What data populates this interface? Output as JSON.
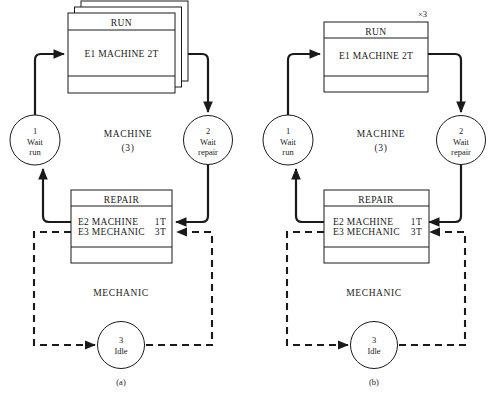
{
  "figure": {
    "background_color": "#ffffff",
    "line_color": "#1a1a1a"
  },
  "panels": [
    {
      "id": "a",
      "caption": "(a)",
      "multiplicity_label": "",
      "run_box": {
        "header": "RUN",
        "body": "E1 MACHINE 2T",
        "stacked": true,
        "stack_count": 3
      },
      "repair_box": {
        "header": "REPAIR",
        "body_line1_left": "E2 MACHINE",
        "body_line1_right": "1T",
        "body_line2_left": "E3 MECHANIC",
        "body_line2_right": "3T"
      },
      "places": [
        {
          "number": "1",
          "label_line1": "Wait",
          "label_line2": "run"
        },
        {
          "number": "2",
          "label_line1": "Wait",
          "label_line2": "repair"
        },
        {
          "number": "3",
          "label_line1": "Idle",
          "label_line2": ""
        }
      ],
      "region_labels": [
        {
          "name": "MACHINE",
          "count": "(3)"
        },
        {
          "name": "MECHANIC",
          "count": ""
        }
      ]
    },
    {
      "id": "b",
      "caption": "(b)",
      "multiplicity_label": "×3",
      "run_box": {
        "header": "RUN",
        "body": "E1 MACHINE 2T",
        "stacked": false,
        "stack_count": 1
      },
      "repair_box": {
        "header": "REPAIR",
        "body_line1_left": "E2 MACHINE",
        "body_line1_right": "1T",
        "body_line2_left": "E3 MECHANIC",
        "body_line2_right": "3T"
      },
      "places": [
        {
          "number": "1",
          "label_line1": "Wait",
          "label_line2": "run"
        },
        {
          "number": "2",
          "label_line1": "Wait",
          "label_line2": "repair"
        },
        {
          "number": "3",
          "label_line1": "Idle",
          "label_line2": ""
        }
      ],
      "region_labels": [
        {
          "name": "MACHINE",
          "count": "(3)"
        },
        {
          "name": "MECHANIC",
          "count": ""
        }
      ]
    }
  ]
}
